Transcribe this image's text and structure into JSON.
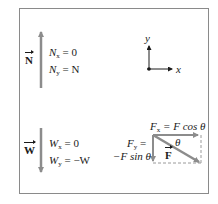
{
  "diagram": {
    "normal_force": {
      "symbol": "N",
      "arrow_direction": "up",
      "x_component": {
        "name": "N",
        "sub": "x",
        "eq": " = 0"
      },
      "y_component": {
        "name": "N",
        "sub": "y",
        "eq": " = N"
      }
    },
    "weight": {
      "symbol": "W",
      "arrow_direction": "down",
      "x_component": {
        "name": "W",
        "sub": "x",
        "eq": " = 0"
      },
      "y_component": {
        "name": "W",
        "sub": "y",
        "eq": " = −W"
      }
    },
    "axes": {
      "x_label": "x",
      "y_label": "y"
    },
    "applied_force": {
      "symbol": "F",
      "angle": "θ",
      "x_component": {
        "name": "F",
        "sub": "x",
        "eq": " = F cos θ"
      },
      "y_component": {
        "name": "F",
        "sub": "y",
        "eq": " =",
        "line2": "−F sin θ"
      }
    },
    "colors": {
      "arrow": "#8c8c8c",
      "frame": "#8a8a8a",
      "text": "#1a1a1a",
      "dashed": "#9a9a9a"
    }
  }
}
